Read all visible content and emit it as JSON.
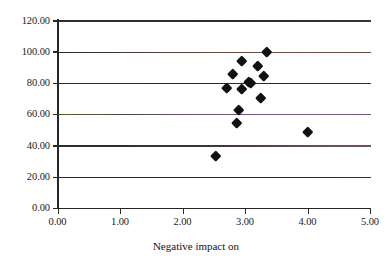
{
  "chart_data": {
    "type": "scatter",
    "title": "",
    "subtitle": "",
    "xlabel": "Negative impact on",
    "ylabel": "",
    "xlim": [
      0,
      5
    ],
    "ylim": [
      0,
      120
    ],
    "xticks": [
      "0.00",
      "1.00",
      "2.00",
      "3.00",
      "4.00",
      "5.00"
    ],
    "xtick_values": [
      0,
      1,
      2,
      3,
      4,
      5
    ],
    "yticks": [
      "0.00",
      "20.00",
      "40.00",
      "60.00",
      "80.00",
      "100.00",
      "120.00"
    ],
    "ytick_values": [
      0,
      20,
      40,
      60,
      80,
      100,
      120
    ],
    "grid": "horizontal",
    "legend": "none",
    "marker": "filled-diamond",
    "marker_color": "#111111",
    "series": [
      {
        "name": "series-1",
        "points": [
          {
            "x": 2.53,
            "y": 33.5
          },
          {
            "x": 2.7,
            "y": 77.0
          },
          {
            "x": 2.8,
            "y": 86.0
          },
          {
            "x": 2.87,
            "y": 55.0
          },
          {
            "x": 2.9,
            "y": 63.0
          },
          {
            "x": 2.95,
            "y": 94.0
          },
          {
            "x": 2.95,
            "y": 76.5
          },
          {
            "x": 3.05,
            "y": 81.0
          },
          {
            "x": 3.08,
            "y": 80.0
          },
          {
            "x": 3.2,
            "y": 91.0
          },
          {
            "x": 3.25,
            "y": 71.0
          },
          {
            "x": 3.3,
            "y": 85.0
          },
          {
            "x": 3.35,
            "y": 100.0
          },
          {
            "x": 4.0,
            "y": 49.0
          }
        ]
      }
    ],
    "gridline_colors": {
      "120": "#2b2b2b",
      "100": "#6b4a3a",
      "80": "#2b2b2b",
      "60": "#7c4f86",
      "40": "#6e4a52",
      "20": "#2b2b2b"
    }
  },
  "axis": {
    "x_title": "Negative impact on"
  }
}
